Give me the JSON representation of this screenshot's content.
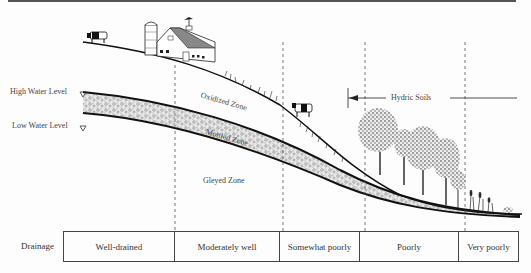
{
  "diagram": {
    "water_levels": {
      "high": "High Water Level",
      "low": "Low Water Level"
    },
    "zones": {
      "oxidized": "Oxidized Zone",
      "mottled": "Mottled Zone",
      "gleyed": "Gleyed Zone"
    },
    "hydric": {
      "label": "Hydric Soils"
    },
    "drainage": {
      "label": "Drainage",
      "classes": [
        "Well-drained",
        "Moderately well",
        "Somewhat poorly",
        "Poorly",
        "Very poorly"
      ]
    },
    "icons": [
      "cow-icon",
      "silo-icon",
      "barn-icon",
      "weathervane-icon",
      "tree-icon",
      "cattail-icon",
      "water-level-triangle-icon",
      "arrow-left-icon"
    ]
  }
}
